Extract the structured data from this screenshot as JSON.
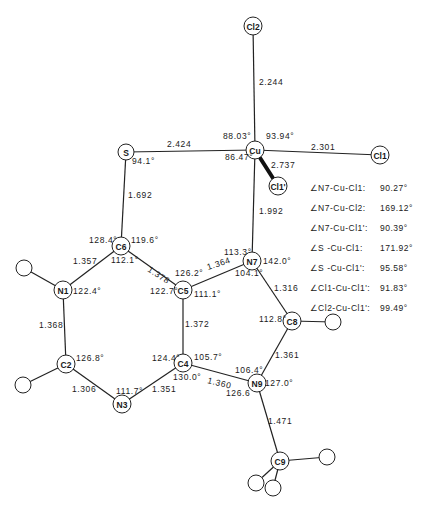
{
  "diagram": {
    "type": "molecular-structure",
    "atoms": [
      {
        "id": "Cl2",
        "label": "Cl2",
        "x": 253,
        "y": 26,
        "r": 9
      },
      {
        "id": "Cu",
        "label": "Cu",
        "x": 255,
        "y": 150,
        "r": 9
      },
      {
        "id": "Cl1",
        "label": "Cl1",
        "x": 380,
        "y": 155,
        "r": 9
      },
      {
        "id": "Cl1p",
        "label": "Cl1'",
        "x": 278,
        "y": 186,
        "r": 9
      },
      {
        "id": "S",
        "label": "S",
        "x": 126,
        "y": 152,
        "r": 8
      },
      {
        "id": "C6",
        "label": "C6",
        "x": 121,
        "y": 246,
        "r": 9
      },
      {
        "id": "N7",
        "label": "N7",
        "x": 252,
        "y": 261,
        "r": 9
      },
      {
        "id": "N1",
        "label": "N1",
        "x": 63,
        "y": 290,
        "r": 9
      },
      {
        "id": "C5",
        "label": "C5",
        "x": 183,
        "y": 290,
        "r": 9
      },
      {
        "id": "C8",
        "label": "C8",
        "x": 292,
        "y": 321,
        "r": 9
      },
      {
        "id": "C2",
        "label": "C2",
        "x": 66,
        "y": 364,
        "r": 9
      },
      {
        "id": "C4",
        "label": "C4",
        "x": 183,
        "y": 363,
        "r": 9
      },
      {
        "id": "N9",
        "label": "N9",
        "x": 257,
        "y": 383,
        "r": 9
      },
      {
        "id": "N3",
        "label": "N3",
        "x": 122,
        "y": 404,
        "r": 9
      },
      {
        "id": "C9",
        "label": "C9",
        "x": 280,
        "y": 461,
        "r": 9
      },
      {
        "id": "H1",
        "label": "",
        "x": 24,
        "y": 268,
        "r": 8
      },
      {
        "id": "H2",
        "label": "",
        "x": 23,
        "y": 385,
        "r": 8
      },
      {
        "id": "H8",
        "label": "",
        "x": 333,
        "y": 322,
        "r": 8
      },
      {
        "id": "H9a",
        "label": "",
        "x": 327,
        "y": 457,
        "r": 8
      },
      {
        "id": "H9b",
        "label": "",
        "x": 256,
        "y": 483,
        "r": 8
      },
      {
        "id": "H9c",
        "label": "",
        "x": 273,
        "y": 488,
        "r": 8
      }
    ],
    "bonds": [
      {
        "a": "Cl2",
        "b": "Cu",
        "style": "line"
      },
      {
        "a": "Cu",
        "b": "Cl1",
        "style": "line"
      },
      {
        "a": "Cu",
        "b": "Cl1p",
        "style": "wedge"
      },
      {
        "a": "S",
        "b": "Cu",
        "style": "line"
      },
      {
        "a": "S",
        "b": "C6",
        "style": "line"
      },
      {
        "a": "Cu",
        "b": "N7",
        "style": "line"
      },
      {
        "a": "C6",
        "b": "N1",
        "style": "line"
      },
      {
        "a": "C6",
        "b": "C5",
        "style": "line"
      },
      {
        "a": "C5",
        "b": "N7",
        "style": "line"
      },
      {
        "a": "N7",
        "b": "C8",
        "style": "line"
      },
      {
        "a": "N1",
        "b": "C2",
        "style": "line"
      },
      {
        "a": "C5",
        "b": "C4",
        "style": "line"
      },
      {
        "a": "C2",
        "b": "N3",
        "style": "line"
      },
      {
        "a": "N3",
        "b": "C4",
        "style": "line"
      },
      {
        "a": "C4",
        "b": "N9",
        "style": "line"
      },
      {
        "a": "C8",
        "b": "N9",
        "style": "line"
      },
      {
        "a": "N9",
        "b": "C9",
        "style": "line"
      },
      {
        "a": "N1",
        "b": "H1",
        "style": "line"
      },
      {
        "a": "C2",
        "b": "H2",
        "style": "line"
      },
      {
        "a": "C8",
        "b": "H8",
        "style": "line"
      },
      {
        "a": "C9",
        "b": "H9a",
        "style": "line"
      },
      {
        "a": "C9",
        "b": "H9b",
        "style": "line"
      },
      {
        "a": "C9",
        "b": "H9c",
        "style": "line"
      }
    ],
    "bond_lengths": [
      {
        "text": "2.244",
        "x": 259,
        "y": 85
      },
      {
        "text": "2.424",
        "x": 167,
        "y": 147
      },
      {
        "text": "2.301",
        "x": 311,
        "y": 150
      },
      {
        "text": "2.737",
        "x": 271,
        "y": 168
      },
      {
        "text": "1.692",
        "x": 128,
        "y": 198
      },
      {
        "text": "1.992",
        "x": 259,
        "y": 214
      },
      {
        "text": "1.357",
        "x": 73,
        "y": 264
      },
      {
        "text": "1.378",
        "x": 147,
        "y": 271,
        "rotate": 33
      },
      {
        "text": "1.364",
        "x": 208,
        "y": 270,
        "rotate": -18
      },
      {
        "text": "1.316",
        "x": 274,
        "y": 291
      },
      {
        "text": "1.368",
        "x": 39,
        "y": 328
      },
      {
        "text": "1.372",
        "x": 185,
        "y": 327
      },
      {
        "text": "1.361",
        "x": 275,
        "y": 358
      },
      {
        "text": "1.306",
        "x": 72,
        "y": 392
      },
      {
        "text": "1.351",
        "x": 152,
        "y": 392
      },
      {
        "text": "1.360",
        "x": 207,
        "y": 383,
        "rotate": 14
      },
      {
        "text": "1.471",
        "x": 268,
        "y": 424
      }
    ],
    "angles_on_diagram": [
      {
        "text": "88.03°",
        "x": 223,
        "y": 139
      },
      {
        "text": "93.94°",
        "x": 266,
        "y": 139
      },
      {
        "text": "86.47°",
        "x": 225,
        "y": 160
      },
      {
        "text": "94.1°",
        "x": 132,
        "y": 164
      },
      {
        "text": "128.4°",
        "x": 89,
        "y": 243
      },
      {
        "text": "119.6°",
        "x": 131,
        "y": 243
      },
      {
        "text": "112.1°",
        "x": 111,
        "y": 263
      },
      {
        "text": "113.3°",
        "x": 224,
        "y": 255
      },
      {
        "text": "142.0°",
        "x": 263,
        "y": 264
      },
      {
        "text": "126.2°",
        "x": 175,
        "y": 276
      },
      {
        "text": "104.1°",
        "x": 235,
        "y": 276
      },
      {
        "text": "122.4°",
        "x": 73,
        "y": 294
      },
      {
        "text": "122.7°",
        "x": 150,
        "y": 294
      },
      {
        "text": "111.1°",
        "x": 194,
        "y": 297
      },
      {
        "text": "112.8°",
        "x": 259,
        "y": 322
      },
      {
        "text": "126.8°",
        "x": 76,
        "y": 361
      },
      {
        "text": "124.4°",
        "x": 152,
        "y": 361
      },
      {
        "text": "105.7°",
        "x": 194,
        "y": 360
      },
      {
        "text": "130.0°",
        "x": 173,
        "y": 380
      },
      {
        "text": "106.4°",
        "x": 235,
        "y": 373
      },
      {
        "text": "127.0°",
        "x": 265,
        "y": 386
      },
      {
        "text": "111.7°",
        "x": 116,
        "y": 394
      },
      {
        "text": "126.6",
        "x": 226,
        "y": 396
      }
    ]
  },
  "angle_table": [
    {
      "label": "∠N7-Cu-Cl1:",
      "value": "90.27°"
    },
    {
      "label": "∠N7-Cu-Cl2:",
      "value": "169.12°"
    },
    {
      "label": "∠N7-Cu-Cl1':",
      "value": "90.39°"
    },
    {
      "label": "∠S -Cu-Cl1:",
      "value": "171.92°"
    },
    {
      "label": "∠S -Cu-Cl1':",
      "value": "95.58°"
    },
    {
      "label": "∠Cl1-Cu-Cl1':",
      "value": "91.83°"
    },
    {
      "label": "∠Cl2-Cu-Cl1':",
      "value": "99.49°"
    }
  ]
}
